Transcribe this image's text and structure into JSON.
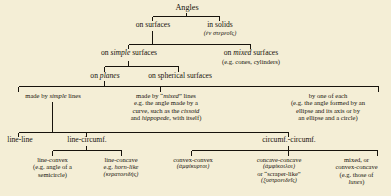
{
  "diagram": {
    "title": "Angles",
    "levels": [
      {
        "id": "level-1",
        "nodes": [
          {
            "id": "on-surfaces",
            "label": "on surfaces"
          },
          {
            "id": "in-solids",
            "label": "in solids",
            "greek": "(ἐν στερεοῖς)"
          }
        ]
      },
      {
        "id": "level-2",
        "nodes": [
          {
            "id": "on-simple-surfaces",
            "pre": "on ",
            "em": "simple",
            "post": " surfaces"
          },
          {
            "id": "on-mixed-surfaces",
            "pre": "on ",
            "em": "mixed",
            "post": " surfaces",
            "note": "(e.g. cones, cylinders)"
          }
        ]
      },
      {
        "id": "level-3",
        "nodes": [
          {
            "id": "on-planes",
            "pre": "on ",
            "em": "planes",
            "post": ""
          },
          {
            "id": "on-spherical-surfaces",
            "label": "on spherical surfaces"
          }
        ]
      },
      {
        "id": "level-4",
        "nodes": [
          {
            "id": "made-by-simple-lines",
            "pre": "made by ",
            "em": "simple",
            "post": " lines"
          },
          {
            "id": "made-by-mixed-lines",
            "head_pre": "made by “",
            "head_em": "mixed",
            "head_post": "” lines",
            "body_1": "e.g. the angle made by a",
            "body_2_pre": "curve, such as the ",
            "body_2_em": "cissoid",
            "body_3_pre": "and ",
            "body_3_em": "hippopede",
            "body_3_post": ", with itself)"
          },
          {
            "id": "by-one-of-each",
            "head": "by one of each",
            "body_1": "(e.g. the angle formed by an",
            "body_2": "ellipse and its axis or by",
            "body_3": "an ellipse and a circle)"
          }
        ]
      },
      {
        "id": "level-5",
        "nodes": [
          {
            "id": "line-line",
            "label": "line-line"
          },
          {
            "id": "line-circumf",
            "label": "line-circumf."
          },
          {
            "id": "circumf-circumf",
            "label": "circumf.-circumf."
          }
        ]
      },
      {
        "id": "level-6",
        "nodes": [
          {
            "id": "line-convex",
            "head": "line-convex",
            "body_1": "(e.g. angle of a",
            "body_2": "semicircle)"
          },
          {
            "id": "line-concave",
            "head": "line-concave",
            "body_1_pre": "e.g. ",
            "body_1_em": "horn-like",
            "greek": "(κερατοειδής)"
          },
          {
            "id": "convex-convex",
            "head": "convex-convex",
            "greek": "(ἀμφίκυρτοι)"
          },
          {
            "id": "concave-concave",
            "head": "concave-concave",
            "greek_1": "(ἀμφίκοιλοι)",
            "body_1": "or “scraper-like”",
            "greek_2": "(ξυστροειδεῖς)"
          },
          {
            "id": "mixed-convex-concave",
            "head_1": "mixed, or",
            "head_2": "convex-concave",
            "body_1": "(e.g. those of",
            "body_2_em": "lunes",
            "body_2_post": ")"
          }
        ]
      }
    ],
    "colors": {
      "page_background": "#f4eed6",
      "ink": "#17130c"
    }
  }
}
